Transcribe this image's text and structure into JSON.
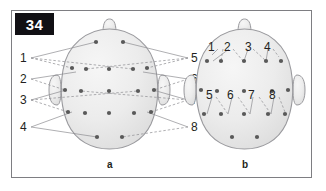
{
  "figure": {
    "number": "34",
    "background_color": "#ffffff",
    "frame_color": "#7e7e82",
    "number_box_color": "#111014",
    "head_fill": "#ebebeb",
    "head_stroke": "#9a9a9e",
    "electrode_color": "#595959",
    "leader_color": "#8d8d91"
  },
  "panels": [
    {
      "id": "a",
      "caption": "a",
      "left_labels": [
        "1",
        "2",
        "3",
        "4"
      ],
      "right_labels": [
        "5",
        "6",
        "7",
        "8"
      ],
      "electrode_rows": [
        2,
        5,
        5,
        5,
        2
      ],
      "electrode_count": 19
    },
    {
      "id": "b",
      "caption": "b",
      "inner_labels_top": [
        "1",
        "2",
        "3",
        "4"
      ],
      "inner_labels_mid": [
        "5",
        "6",
        "7",
        "8"
      ],
      "electrode_rows": [
        5,
        5,
        5,
        2
      ],
      "electrode_count": 17
    }
  ],
  "labels": {
    "a_left_1": "1",
    "a_left_2": "2",
    "a_left_3": "3",
    "a_left_4": "4",
    "a_right_5": "5",
    "a_right_6": "6",
    "a_right_7": "7",
    "a_right_8": "8",
    "a_caption": "a",
    "b_1": "1",
    "b_2": "2",
    "b_3": "3",
    "b_4": "4",
    "b_5": "5",
    "b_6": "6",
    "b_7": "7",
    "b_8": "8",
    "b_caption": "b"
  }
}
